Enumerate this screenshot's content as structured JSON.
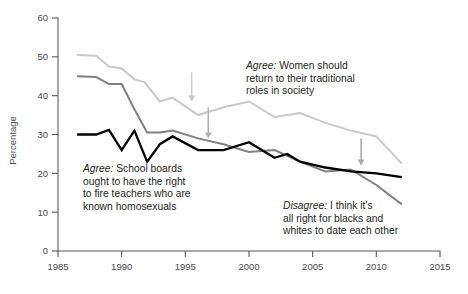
{
  "chart_data": {
    "type": "line",
    "title": "",
    "xlabel": "",
    "ylabel": "Percentage",
    "xlim": [
      1985,
      2015
    ],
    "ylim": [
      0,
      60
    ],
    "xticks": [
      1985,
      1990,
      1995,
      2000,
      2005,
      2010,
      2015
    ],
    "xtick_labels": [
      "1985",
      "1990",
      "1995",
      "2000",
      "2005",
      "2010",
      "2015"
    ],
    "yticks": [
      0,
      10,
      20,
      30,
      40,
      50,
      60
    ],
    "ytick_labels": [
      "0",
      "10",
      "20",
      "30",
      "40",
      "50",
      "60"
    ],
    "grid": false,
    "legend": "annotations",
    "series": [
      {
        "name": "Agree: Women should return to their traditional roles in society",
        "color": "#c9c9c9",
        "width": 2.0,
        "x": [
          1986.5,
          1988,
          1989,
          1990,
          1991,
          1991.8,
          1993,
          1994,
          1996,
          1998,
          2000,
          2002,
          2004,
          2006,
          2008,
          2010,
          2012
        ],
        "y": [
          50.5,
          50.3,
          47.5,
          47.0,
          44.2,
          43.5,
          38.5,
          39.5,
          35.0,
          37.0,
          38.5,
          34.5,
          35.5,
          33.0,
          31.0,
          29.5,
          22.5
        ]
      },
      {
        "name": "Agree: School boards ought to have the right to fire teachers who are known homosexuals",
        "color": "#808080",
        "width": 2.0,
        "x": [
          1986.5,
          1988,
          1989,
          1990,
          1991,
          1992,
          1993,
          1994,
          1996,
          1998,
          2000,
          2002,
          2004,
          2006,
          2008,
          2010,
          2012
        ],
        "y": [
          45.0,
          44.8,
          43.0,
          43.0,
          36.5,
          30.5,
          30.5,
          31.0,
          29.0,
          27.5,
          25.5,
          26.0,
          23.0,
          20.5,
          21.0,
          17.0,
          12.0
        ]
      },
      {
        "name": "Disagree: I think it's all right for blacks and whites to date each other",
        "color": "#000000",
        "width": 2.3,
        "x": [
          1986.5,
          1988,
          1989,
          1990,
          1991,
          1992,
          1993,
          1994,
          1996,
          1998,
          2000,
          2002,
          2003,
          2004,
          2006,
          2008,
          2010,
          2012
        ],
        "y": [
          30.0,
          30.0,
          31.2,
          26.0,
          31.0,
          23.0,
          27.5,
          29.5,
          26.0,
          26.0,
          28.0,
          24.0,
          25.0,
          23.0,
          21.5,
          20.5,
          20.0,
          19.0
        ]
      }
    ],
    "annotations": [
      {
        "id": "women",
        "lead": "Agree:",
        "text": " Women should\nreturn to their traditional\nroles in society",
        "points_to": "Agree: Women should return to their traditional roles in society"
      },
      {
        "id": "school",
        "lead": "Agree:",
        "text": " School boards\nought to have the right\nto fire teachers who are\nknown homosexuals",
        "points_to": "Agree: School boards ought to have the right to fire teachers who are known homosexuals"
      },
      {
        "id": "date",
        "lead": "Disagree:",
        "text": " I think it's\nall right for blacks and\nwhites to date each other",
        "points_to": "Disagree: I think it's all right for blacks and whites to date each other"
      }
    ],
    "arrows": [
      {
        "id": "arrow-women",
        "x": 1995.5,
        "y_from": 46.0,
        "y_to": 38.5,
        "color": "#c9c9c9"
      },
      {
        "id": "arrow-school",
        "x": 1996.8,
        "y_from": 37.0,
        "y_to": 29.0,
        "color": "#b0b0b0"
      },
      {
        "id": "arrow-date",
        "x": 2008.8,
        "y_from": 29.0,
        "y_to": 22.0,
        "color": "#a8a8a8"
      }
    ]
  },
  "axis": {
    "y_title": "Percentage"
  }
}
